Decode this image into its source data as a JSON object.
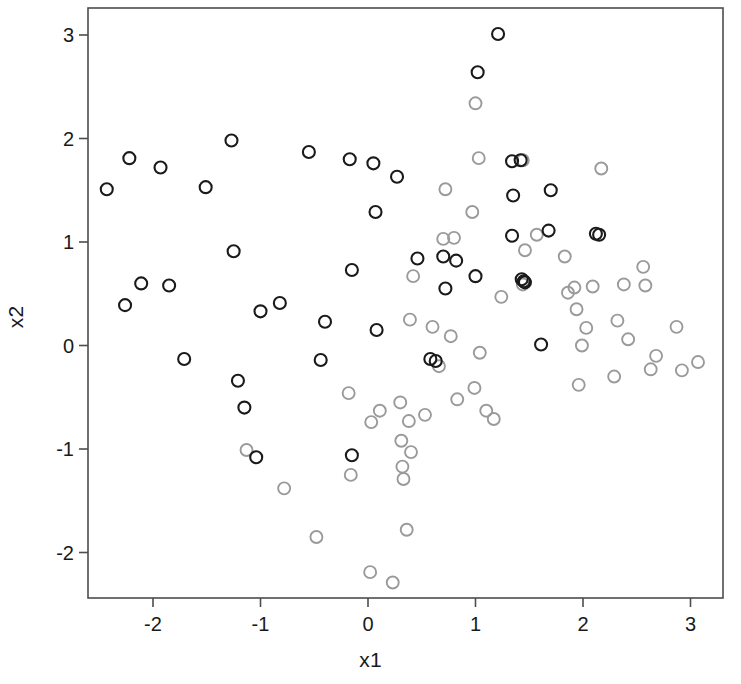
{
  "chart_data": {
    "type": "scatter",
    "title": "",
    "xlabel": "x1",
    "ylabel": "x2",
    "xlim": [
      -2.6,
      3.3
    ],
    "ylim": [
      -2.45,
      3.2
    ],
    "xticks": [
      -2,
      -1,
      0,
      1,
      2,
      3
    ],
    "xtick_labels": [
      "-2",
      "-1",
      "0",
      "1",
      "2",
      "3"
    ],
    "yticks": [
      -2,
      -1,
      0,
      1,
      2,
      3
    ],
    "ytick_labels": [
      "-2",
      "-1",
      "0",
      "1",
      "2",
      "3"
    ],
    "grid": false,
    "legend": null,
    "marker": "open-circle",
    "marker_radius_px": 6,
    "series": [
      {
        "name": "class-dark",
        "color": "#1a1a1a",
        "fill": "none",
        "stroke_width": 2.1,
        "points": [
          [
            -2.43,
            1.51
          ],
          [
            -2.26,
            0.39
          ],
          [
            -2.22,
            1.81
          ],
          [
            -2.11,
            0.6
          ],
          [
            -1.93,
            1.72
          ],
          [
            -1.85,
            0.58
          ],
          [
            -1.71,
            -0.13
          ],
          [
            -1.51,
            1.53
          ],
          [
            -1.27,
            1.98
          ],
          [
            -1.25,
            0.91
          ],
          [
            -1.21,
            -0.34
          ],
          [
            -1.15,
            -0.6
          ],
          [
            -1.04,
            -1.08
          ],
          [
            -1.0,
            0.33
          ],
          [
            -0.82,
            0.41
          ],
          [
            -0.55,
            1.87
          ],
          [
            -0.44,
            -0.14
          ],
          [
            -0.4,
            0.23
          ],
          [
            -0.17,
            1.8
          ],
          [
            -0.15,
            0.73
          ],
          [
            -0.15,
            -1.06
          ],
          [
            0.05,
            1.76
          ],
          [
            0.07,
            1.29
          ],
          [
            0.08,
            0.15
          ],
          [
            0.27,
            1.63
          ],
          [
            0.46,
            0.84
          ],
          [
            0.58,
            -0.13
          ],
          [
            0.63,
            -0.15
          ],
          [
            0.7,
            0.86
          ],
          [
            0.72,
            0.55
          ],
          [
            0.82,
            0.82
          ],
          [
            1.0,
            0.67
          ],
          [
            1.02,
            2.64
          ],
          [
            1.21,
            3.01
          ],
          [
            1.34,
            1.78
          ],
          [
            1.34,
            1.06
          ],
          [
            1.35,
            1.45
          ],
          [
            1.42,
            1.79
          ],
          [
            1.43,
            0.64
          ],
          [
            1.45,
            0.62
          ],
          [
            1.46,
            0.61
          ],
          [
            1.61,
            0.01
          ],
          [
            1.68,
            1.11
          ],
          [
            1.7,
            1.5
          ],
          [
            2.12,
            1.08
          ],
          [
            2.15,
            1.07
          ]
        ]
      },
      {
        "name": "class-light",
        "color": "#9a9a9a",
        "fill": "none",
        "stroke_width": 1.9,
        "points": [
          [
            -1.13,
            -1.01
          ],
          [
            -0.78,
            -1.38
          ],
          [
            -0.48,
            -1.85
          ],
          [
            -0.18,
            -0.46
          ],
          [
            -0.16,
            -1.25
          ],
          [
            0.02,
            -2.19
          ],
          [
            0.03,
            -0.74
          ],
          [
            0.11,
            -0.63
          ],
          [
            0.23,
            -2.29
          ],
          [
            0.3,
            -0.55
          ],
          [
            0.31,
            -0.92
          ],
          [
            0.32,
            -1.17
          ],
          [
            0.33,
            -1.29
          ],
          [
            0.36,
            -1.78
          ],
          [
            0.38,
            -0.73
          ],
          [
            0.39,
            0.25
          ],
          [
            0.4,
            -1.03
          ],
          [
            0.42,
            0.67
          ],
          [
            0.53,
            -0.67
          ],
          [
            0.6,
            0.18
          ],
          [
            0.66,
            -0.2
          ],
          [
            0.7,
            1.03
          ],
          [
            0.72,
            1.51
          ],
          [
            0.77,
            0.09
          ],
          [
            0.8,
            1.04
          ],
          [
            0.83,
            -0.52
          ],
          [
            0.97,
            1.29
          ],
          [
            0.99,
            -0.41
          ],
          [
            1.0,
            2.34
          ],
          [
            1.03,
            1.81
          ],
          [
            1.04,
            -0.07
          ],
          [
            1.1,
            -0.63
          ],
          [
            1.17,
            -0.71
          ],
          [
            1.24,
            0.47
          ],
          [
            1.44,
            1.79
          ],
          [
            1.44,
            0.59
          ],
          [
            1.46,
            0.92
          ],
          [
            1.57,
            1.07
          ],
          [
            1.83,
            0.86
          ],
          [
            1.86,
            0.51
          ],
          [
            1.92,
            0.56
          ],
          [
            1.94,
            0.35
          ],
          [
            1.96,
            -0.38
          ],
          [
            1.99,
            0.0
          ],
          [
            2.03,
            0.17
          ],
          [
            2.09,
            0.57
          ],
          [
            2.17,
            1.71
          ],
          [
            2.29,
            -0.3
          ],
          [
            2.32,
            0.24
          ],
          [
            2.38,
            0.59
          ],
          [
            2.42,
            0.06
          ],
          [
            2.56,
            0.76
          ],
          [
            2.58,
            0.58
          ],
          [
            2.63,
            -0.23
          ],
          [
            2.68,
            -0.1
          ],
          [
            2.87,
            0.18
          ],
          [
            2.92,
            -0.24
          ],
          [
            3.07,
            -0.16
          ]
        ]
      }
    ]
  },
  "axes_geometry": {
    "frame_left_px": 88,
    "frame_top_px": 8,
    "frame_right_px": 723,
    "frame_bottom_px": 598,
    "x_origin_px": 368,
    "x_scale_px_per_unit": 107.5,
    "y_origin_px": 345.5,
    "y_scale_px_per_unit": 103.5,
    "frame_color": "#4d4d4d",
    "frame_width": 1.6,
    "tick_length_px": 9
  }
}
